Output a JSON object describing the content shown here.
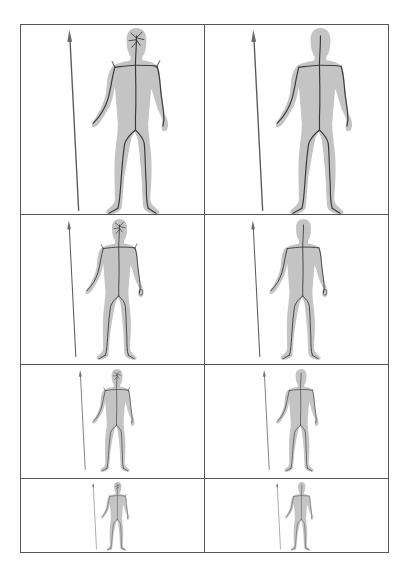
{
  "figure": {
    "rows": 4,
    "columns": 2,
    "columns_meaning": [
      "skeleton with spurious head branches",
      "pruned skeleton"
    ],
    "border_color": "#555555",
    "silhouette_color": "#c4c4c4",
    "skeleton_color": "#3a3a3a"
  },
  "cells": [
    {
      "row": 1,
      "col": 1,
      "scale": 1.0,
      "head_branches": true
    },
    {
      "row": 1,
      "col": 2,
      "scale": 1.0,
      "head_branches": false
    },
    {
      "row": 2,
      "col": 1,
      "scale": 0.74,
      "head_branches": true
    },
    {
      "row": 2,
      "col": 2,
      "scale": 0.74,
      "head_branches": false
    },
    {
      "row": 3,
      "col": 1,
      "scale": 0.53,
      "head_branches": true
    },
    {
      "row": 3,
      "col": 2,
      "scale": 0.53,
      "head_branches": false
    },
    {
      "row": 4,
      "col": 1,
      "scale": 0.34,
      "head_branches": true
    },
    {
      "row": 4,
      "col": 2,
      "scale": 0.34,
      "head_branches": false
    }
  ]
}
